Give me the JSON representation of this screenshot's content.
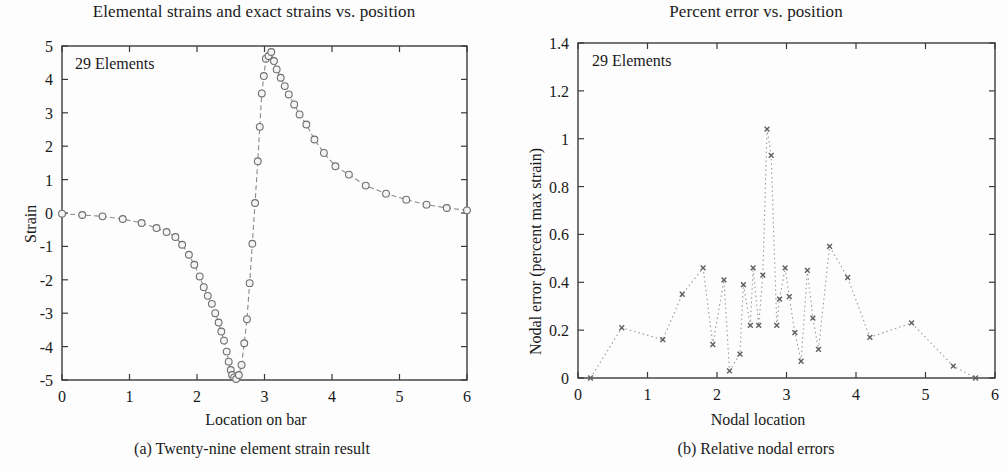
{
  "figure": {
    "panels": [
      {
        "id": "a",
        "title": "Elemental strains and exact strains vs. position",
        "caption": "(a) Twenty-nine element strain result",
        "annotation": "29 Elements",
        "xlabel": "Location on bar",
        "ylabel": "Strain"
      },
      {
        "id": "b",
        "title": "Percent error vs. position",
        "caption": "(b) Relative nodal errors",
        "annotation": "29 Elements",
        "xlabel": "Nodal location",
        "ylabel": "Nodal error (percent max strain)"
      }
    ]
  },
  "chart_data": [
    {
      "type": "line",
      "id": "elemental-strain-plot",
      "title": "Elemental strains and exact strains vs. position",
      "xlabel": "Location on bar",
      "ylabel": "Strain",
      "annotation": "29 Elements",
      "xlim": [
        0,
        6
      ],
      "ylim": [
        -5,
        5
      ],
      "xticks": [
        0,
        1,
        2,
        3,
        4,
        5,
        6
      ],
      "xticklabels": [
        "0",
        "1",
        "2",
        "3",
        "4",
        "5",
        "6"
      ],
      "yticks": [
        -5,
        -4,
        -3,
        -2,
        -1,
        0,
        1,
        2,
        3,
        4,
        5
      ],
      "yticklabels": [
        "-5",
        "-4",
        "-3",
        "-2",
        "-1",
        "0",
        "1",
        "2",
        "3",
        "4",
        "5"
      ],
      "grid": false,
      "legend": null,
      "linestyle": "dashed",
      "marker": "circle-open",
      "color": "#8a8a8a",
      "series": [
        {
          "name": "Elemental strain",
          "x": [
            0.0,
            0.3,
            0.6,
            0.9,
            1.18,
            1.4,
            1.55,
            1.68,
            1.78,
            1.88,
            1.96,
            2.04,
            2.1,
            2.16,
            2.22,
            2.27,
            2.32,
            2.36,
            2.4,
            2.44,
            2.47,
            2.5,
            2.52,
            2.55,
            2.58,
            2.62,
            2.66,
            2.7,
            2.74,
            2.78,
            2.82,
            2.86,
            2.9,
            2.93,
            2.96,
            2.99,
            3.02,
            3.06,
            3.1,
            3.14,
            3.18,
            3.24,
            3.3,
            3.36,
            3.44,
            3.52,
            3.62,
            3.74,
            3.88,
            4.05,
            4.25,
            4.5,
            4.8,
            5.1,
            5.4,
            5.7,
            6.0
          ],
          "y": [
            -0.02,
            -0.06,
            -0.1,
            -0.18,
            -0.3,
            -0.45,
            -0.57,
            -0.72,
            -0.95,
            -1.25,
            -1.55,
            -1.9,
            -2.22,
            -2.48,
            -2.72,
            -3.0,
            -3.28,
            -3.55,
            -3.82,
            -4.15,
            -4.45,
            -4.7,
            -4.85,
            -4.92,
            -4.97,
            -4.85,
            -4.55,
            -3.9,
            -3.18,
            -2.1,
            -0.92,
            0.3,
            1.55,
            2.58,
            3.58,
            4.1,
            4.62,
            4.7,
            4.82,
            4.55,
            4.3,
            4.05,
            3.8,
            3.55,
            3.25,
            2.95,
            2.65,
            2.2,
            1.8,
            1.4,
            1.15,
            0.82,
            0.58,
            0.4,
            0.25,
            0.15,
            0.08
          ]
        }
      ]
    },
    {
      "type": "scatter",
      "id": "percent-error-plot",
      "title": "Percent error vs. position",
      "xlabel": "Nodal location",
      "ylabel": "Nodal error (percent max strain)",
      "annotation": "29 Elements",
      "xlim": [
        0,
        6
      ],
      "ylim": [
        0,
        1.4
      ],
      "xticks": [
        0,
        1,
        2,
        3,
        4,
        5,
        6
      ],
      "xticklabels": [
        "0",
        "1",
        "2",
        "3",
        "4",
        "5",
        "6"
      ],
      "yticks": [
        0,
        0.2,
        0.4,
        0.6,
        0.8,
        1.0,
        1.2,
        1.4
      ],
      "yticklabels": [
        "0",
        "0.2",
        "0.4",
        "0.6",
        "0.8",
        "1",
        "1.2",
        "1.4"
      ],
      "grid": false,
      "legend": null,
      "linestyle": "dotted",
      "marker": "x",
      "color": "#9a9a9a",
      "series": [
        {
          "name": "Nodal error",
          "x": [
            0.18,
            0.63,
            1.22,
            1.5,
            1.8,
            1.94,
            2.1,
            2.18,
            2.33,
            2.38,
            2.48,
            2.52,
            2.6,
            2.66,
            2.72,
            2.78,
            2.86,
            2.9,
            2.98,
            3.04,
            3.12,
            3.21,
            3.3,
            3.38,
            3.46,
            3.62,
            3.88,
            4.2,
            4.8,
            5.4,
            5.72
          ],
          "y": [
            0.0,
            0.21,
            0.16,
            0.35,
            0.46,
            0.14,
            0.41,
            0.03,
            0.1,
            0.39,
            0.22,
            0.46,
            0.22,
            0.43,
            1.04,
            0.93,
            0.22,
            0.33,
            0.46,
            0.34,
            0.19,
            0.07,
            0.45,
            0.25,
            0.12,
            0.55,
            0.42,
            0.17,
            0.23,
            0.05,
            0.0
          ]
        }
      ]
    }
  ]
}
